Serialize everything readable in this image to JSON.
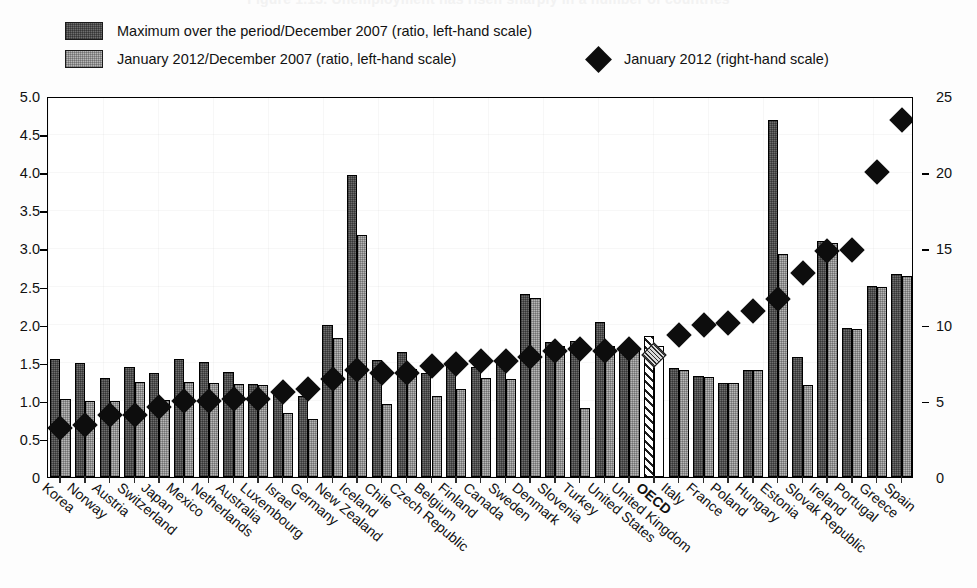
{
  "title_ghost": "Figure 1.13. Unemployment has risen sharply in a number of countries",
  "legend": {
    "items": [
      {
        "marker": "bar-dark-swatch",
        "label": "Maximum over the period/December 2007 (ratio, left-hand scale)"
      },
      {
        "marker": "bar-light-swatch",
        "label": "January 2012/December 2007 (ratio, left-hand scale)"
      },
      {
        "marker": "diamond-swatch",
        "label": "January 2012 (right-hand scale)"
      }
    ]
  },
  "colors": {
    "bar_max": "#6e6e6e",
    "bar_jan": "#b7b7b7",
    "diamond": "#0d0d0d",
    "axis": "#000000"
  },
  "axes": {
    "left_ticks": [
      "5.0",
      "4.5",
      "4.0",
      "3.5",
      "3.0",
      "2.5",
      "2.0",
      "1.5",
      "1.0",
      "0.5",
      "0"
    ],
    "right_ticks": [
      "25",
      "20",
      "15",
      "10",
      "5",
      "0"
    ]
  },
  "chart_data": {
    "type": "bar",
    "title": "Unemployment has risen sharply in a number of countries",
    "xlabel": "",
    "ylabel": "",
    "ylim": [
      0,
      5.0
    ],
    "y2lim": [
      0,
      25
    ],
    "grid": true,
    "legend_position": "top",
    "categories": [
      "Korea",
      "Norway",
      "Austria",
      "Switzerland",
      "Japan",
      "Mexico",
      "Netherlands",
      "Australia",
      "Luxembourg",
      "Israel",
      "Germany",
      "New Zealand",
      "Iceland",
      "Chile",
      "Czech Republic",
      "Belgium",
      "Finland",
      "Canada",
      "Sweden",
      "Denmark",
      "Slovenia",
      "Turkey",
      "United States",
      "United Kingdom",
      "OECD",
      "Italy",
      "France",
      "Poland",
      "Hungary",
      "Estonia",
      "Slovak Republic",
      "Ireland",
      "Portugal",
      "Greece",
      "Spain"
    ],
    "series": [
      {
        "name": "Maximum over the period/December 2007 (ratio, left-hand scale)",
        "axis": "left",
        "values": [
          1.55,
          1.49,
          1.3,
          1.45,
          1.36,
          1.55,
          1.51,
          1.38,
          1.22,
          1.14,
          1.06,
          1.99,
          3.97,
          1.53,
          1.64,
          1.37,
          1.46,
          1.45,
          1.53,
          2.4,
          1.77,
          1.79,
          2.03,
          1.72,
          1.85,
          1.43,
          1.32,
          1.24,
          1.41,
          4.68,
          1.57,
          3.1,
          1.95,
          2.51,
          2.66
        ]
      },
      {
        "name": "January 2012/December 2007 (ratio, left-hand scale)",
        "axis": "left",
        "values": [
          1.03,
          1.0,
          1.0,
          1.25,
          1.01,
          1.25,
          1.24,
          1.22,
          1.21,
          0.84,
          0.76,
          1.82,
          3.18,
          0.96,
          1.42,
          1.06,
          1.16,
          1.3,
          1.28,
          2.35,
          1.72,
          0.91,
          1.72,
          1.69,
          1.72,
          1.41,
          1.31,
          1.23,
          1.4,
          2.93,
          1.21,
          3.07,
          1.94,
          2.5,
          2.64
        ]
      },
      {
        "name": "January 2012 (right-hand scale)",
        "axis": "right",
        "type": "scatter",
        "marker": "diamond",
        "values": [
          3.2,
          3.4,
          4.1,
          4.1,
          4.6,
          5.0,
          5.0,
          5.1,
          5.1,
          5.6,
          5.8,
          6.4,
          7.0,
          6.8,
          6.8,
          7.3,
          7.4,
          7.6,
          7.6,
          7.9,
          8.3,
          8.4,
          8.3,
          8.4,
          8.0,
          9.3,
          10.0,
          10.1,
          10.9,
          11.7,
          13.4,
          14.8,
          14.9,
          20.0,
          23.4
        ]
      }
    ]
  }
}
